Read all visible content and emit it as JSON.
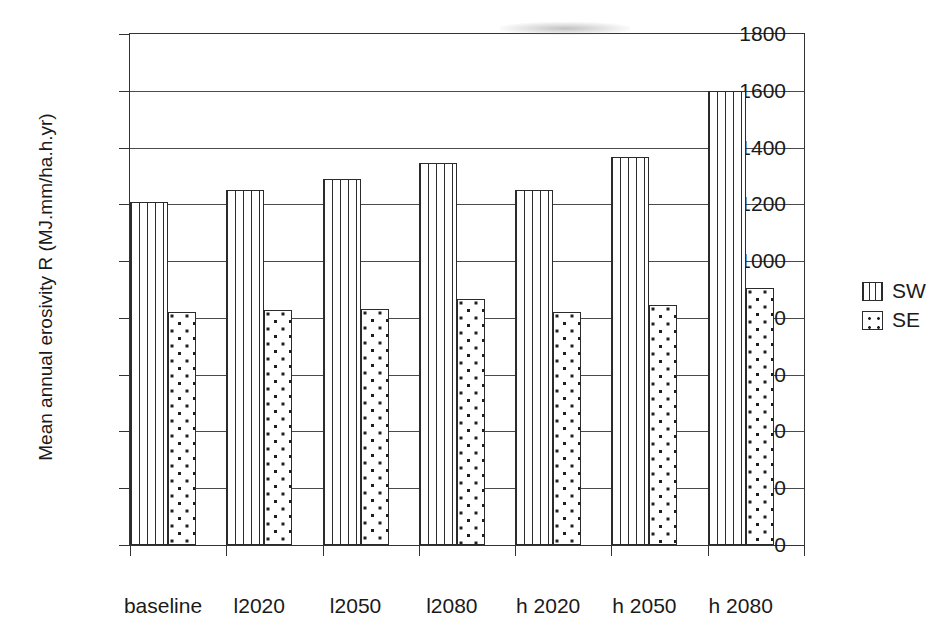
{
  "chart_data": {
    "type": "bar",
    "title": "",
    "xlabel": "",
    "ylabel": "Mean annual erosivity R (MJ.mm/ha.h.yr)",
    "categories": [
      "baseline",
      "l2020",
      "l2050",
      "l2080",
      "h 2020",
      "h 2050",
      "h 2080"
    ],
    "series": [
      {
        "name": "SW",
        "values": [
          1210,
          1250,
          1290,
          1345,
          1252,
          1368,
          1598
        ]
      },
      {
        "name": "SE",
        "values": [
          820,
          828,
          833,
          868,
          820,
          847,
          905
        ]
      }
    ],
    "ylim": [
      0,
      1800
    ],
    "yticks": [
      0,
      200,
      400,
      600,
      800,
      1000,
      1200,
      1400,
      1600,
      1800
    ],
    "ytick_labels": [
      "0",
      "200",
      "400",
      "600",
      "800",
      "1000",
      "1200",
      "1400",
      "1600",
      "1800"
    ],
    "grid": "horizontal",
    "legend_position": "right",
    "legend": [
      {
        "label": "SW",
        "pattern": "vertical-stripes"
      },
      {
        "label": "SE",
        "pattern": "dots"
      }
    ],
    "colors": {
      "line": "#333333",
      "grid": "#4a4a4a",
      "bar_outline": "#2b2b2b",
      "background": "#ffffff"
    }
  }
}
